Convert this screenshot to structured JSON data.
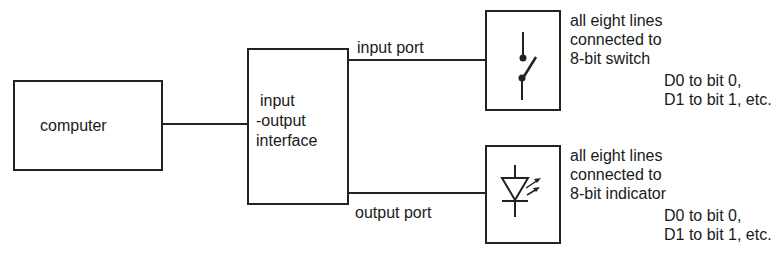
{
  "diagram": {
    "computer": {
      "label": "computer"
    },
    "interface": {
      "label_lines": [
        "input",
        "-output",
        "interface"
      ]
    },
    "input_port": {
      "label": "input port"
    },
    "output_port": {
      "label": "output port"
    },
    "switch_block": {
      "icon": "switch-icon",
      "note_lines": [
        "all eight lines",
        "connected to",
        "8-bit switch"
      ],
      "mapping_lines": [
        "D0 to bit 0,",
        "D1 to bit 1, etc."
      ]
    },
    "indicator_block": {
      "icon": "led-icon",
      "note_lines": [
        "all eight lines",
        "connected to",
        "8-bit indicator"
      ],
      "mapping_lines": [
        "D0 to bit 0,",
        "D1 to bit 1, etc."
      ]
    }
  }
}
